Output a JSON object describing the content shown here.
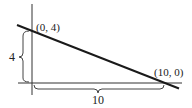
{
  "diagram": {
    "type": "line-intercepts",
    "points": [
      {
        "label": "(0, 4)",
        "x": 0,
        "y": 4
      },
      {
        "label": "(10, 0)",
        "x": 10,
        "y": 0
      }
    ],
    "height_label": "4",
    "width_label": "10",
    "colors": {
      "line": "#1a1a1a",
      "axis": "#333333",
      "brace": "#444444",
      "background": "#ffffff"
    }
  }
}
